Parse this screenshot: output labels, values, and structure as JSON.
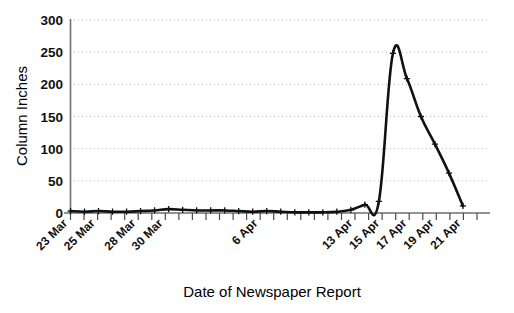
{
  "chart_data": {
    "type": "line",
    "title": "",
    "xlabel": "Date of Newspaper Report",
    "ylabel": "Column Inches",
    "ylim": [
      0,
      300
    ],
    "yticks": [
      0,
      50,
      100,
      150,
      200,
      250,
      300
    ],
    "ytick_labels": [
      "0",
      "50",
      "100",
      "150",
      "200",
      "250",
      "300"
    ],
    "grid": true,
    "grid_axis": "y",
    "grid_style": "dotted",
    "legend": "none",
    "marker": "plus",
    "line_color": "#111111",
    "x": [
      "23 Mar",
      "24 Mar",
      "25 Mar",
      "26 Mar",
      "27 Mar",
      "28 Mar",
      "29 Mar",
      "30 Mar",
      "31 Mar",
      "1 Apr",
      "2 Apr",
      "3 Apr",
      "4 Apr",
      "5 Apr",
      "6 Apr",
      "7 Apr",
      "8 Apr",
      "9 Apr",
      "10 Apr",
      "11 Apr",
      "12 Apr",
      "13 Apr",
      "14 Apr",
      "15 Apr",
      "16 Apr",
      "17 Apr",
      "18 Apr",
      "19 Apr",
      "20 Apr"
    ],
    "values": [
      3,
      2,
      3,
      2,
      2,
      3,
      4,
      6,
      5,
      4,
      4,
      4,
      3,
      2,
      3,
      2,
      1,
      1,
      1,
      2,
      5,
      13,
      18,
      248,
      209,
      150,
      107,
      62,
      11
    ],
    "xtick_labels": [
      "23 Mar",
      "25 Mar",
      "28 Mar",
      "30 Mar",
      "6 Apr",
      "13 Apr",
      "15 Apr",
      "17 Apr",
      "19 Apr",
      "21 Apr"
    ],
    "xtick_positions": [
      0,
      2,
      5,
      7,
      14,
      21,
      23,
      25,
      27,
      29
    ],
    "xtick_minor_count": 30,
    "peak": {
      "label": "15 Apr",
      "value": 248
    },
    "annotations": []
  },
  "axes": {
    "y_title": "Column Inches",
    "x_title": "Date of Newspaper Report"
  },
  "y_labels": {
    "t0": "0",
    "t1": "50",
    "t2": "100",
    "t3": "150",
    "t4": "200",
    "t5": "250",
    "t6": "300"
  },
  "x_labels": {
    "l0": "23 Mar",
    "l1": "25 Mar",
    "l2": "28 Mar",
    "l3": "30 Mar",
    "l4": "6 Apr",
    "l5": "13 Apr",
    "l6": "15 Apr",
    "l7": "17 Apr",
    "l8": "19 Apr",
    "l9": "21 Apr"
  }
}
